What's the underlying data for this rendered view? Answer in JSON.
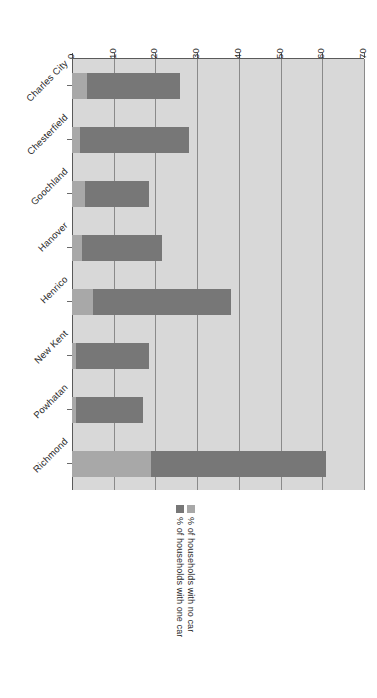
{
  "chart_data": {
    "type": "bar",
    "orientation": "horizontal-stacked",
    "title": "",
    "subtitle": "",
    "xlabel": "",
    "ylabel": "",
    "xlim": [
      0,
      70
    ],
    "xticks": [
      "0",
      "10",
      "20",
      "30",
      "40",
      "50",
      "60",
      "70"
    ],
    "xtick_values": [
      0,
      10,
      20,
      30,
      40,
      50,
      60,
      70
    ],
    "grid": true,
    "stacked": true,
    "legend_position": "bottom",
    "categories": [
      "Charles City",
      "Chesterfield",
      "Goochland",
      "Hanover",
      "Henrico",
      "New Kent",
      "Powhatan",
      "Richmond"
    ],
    "series": [
      {
        "name": "% of households with no car",
        "color": "#a8a8a8",
        "values": [
          3.5,
          2,
          3,
          2.5,
          5,
          1,
          1,
          19
        ]
      },
      {
        "name": "% of households with one car",
        "color": "#777777",
        "values": [
          22.5,
          26,
          15.5,
          19,
          33,
          17.5,
          16,
          42
        ]
      }
    ],
    "totals": [
      26,
      28,
      18.5,
      21.5,
      38,
      18.5,
      17,
      61
    ]
  },
  "legend": {
    "items": [
      {
        "label": "% of households with one car",
        "color": "#777777"
      },
      {
        "label": "% of households with no car",
        "color": "#a8a8a8"
      }
    ]
  },
  "colors": {
    "plot_background": "#d8d8d8",
    "gridline": "#8a8a8a",
    "axis": "#5a5a5a",
    "series_one_car": "#777777",
    "series_no_car": "#a8a8a8",
    "page_background": "#ffffff",
    "text": "#2a2a2a"
  }
}
